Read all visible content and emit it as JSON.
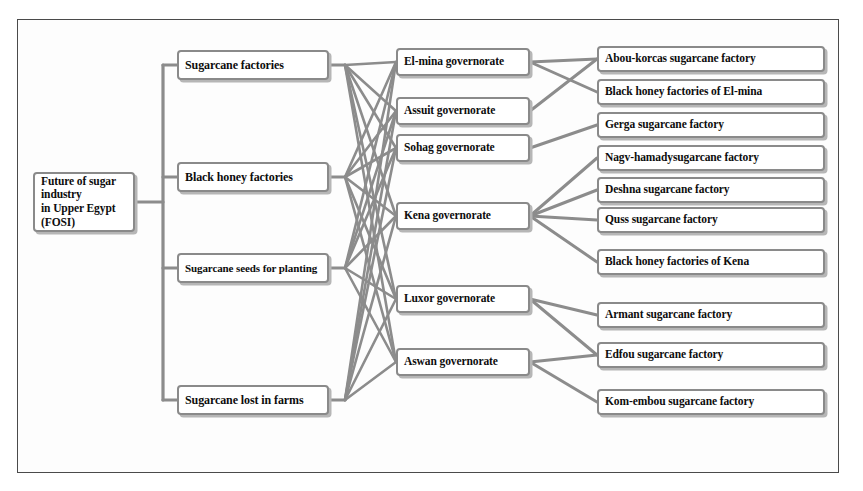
{
  "diagram": {
    "root": {
      "id": "root",
      "label_line1": "Future of sugar industry",
      "label_line2": "in Upper Egypt (FOSI)"
    },
    "level2": [
      {
        "id": "sugarcane-factories",
        "label": "Sugarcane factories"
      },
      {
        "id": "black-honey-factories",
        "label": "Black honey factories"
      },
      {
        "id": "sugarcane-seeds",
        "label": "Sugarcane seeds for planting"
      },
      {
        "id": "sugarcane-lost",
        "label": "Sugarcane lost in farms"
      }
    ],
    "level3": [
      {
        "id": "el-mina",
        "label": "El-mina governorate"
      },
      {
        "id": "assuit",
        "label": "Assuit governorate"
      },
      {
        "id": "sohag",
        "label": "Sohag governorate"
      },
      {
        "id": "kena",
        "label": "Kena governorate"
      },
      {
        "id": "luxor",
        "label": "Luxor governorate"
      },
      {
        "id": "aswan",
        "label": "Aswan governorate"
      }
    ],
    "level4": [
      {
        "id": "abou-korcas",
        "label": "Abou-korcas sugarcane factory"
      },
      {
        "id": "black-honey-el-mina",
        "label": "Black honey factories  of El-mina"
      },
      {
        "id": "gerga",
        "label": "Gerga sugarcane factory"
      },
      {
        "id": "nagy-hamady",
        "label": "Nagv-hamadysugarcane factory"
      },
      {
        "id": "deshna",
        "label": "Deshna sugarcane factory"
      },
      {
        "id": "quss",
        "label": "Quss sugarcane factory"
      },
      {
        "id": "black-honey-kena",
        "label": "Black honey factories  of Kena"
      },
      {
        "id": "armant",
        "label": "Armant sugarcane factory"
      },
      {
        "id": "edfou",
        "label": "Edfou  sugarcane factory"
      },
      {
        "id": "kom-embou",
        "label": "Kom-embou  sugarcane factory"
      }
    ],
    "colors": {
      "node_border": "#8a8a8a",
      "node_fill": "#ffffff",
      "edge": "#8c8c8c",
      "text": "#0d0d0d",
      "frame": "#4a4a4a"
    }
  }
}
